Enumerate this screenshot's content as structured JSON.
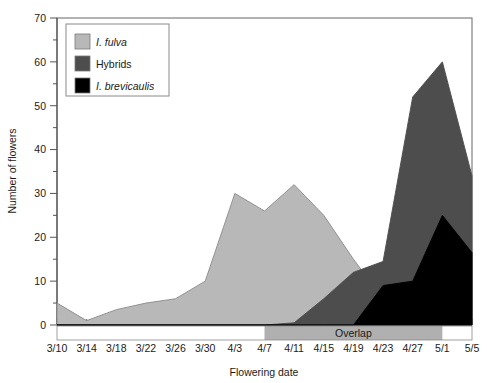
{
  "chart_data": {
    "type": "area",
    "title": "",
    "xlabel": "Flowering date",
    "ylabel": "Number of flowers",
    "categories": [
      "3/10",
      "3/14",
      "3/18",
      "3/22",
      "3/26",
      "3/30",
      "4/3",
      "4/7",
      "4/11",
      "4/15",
      "4/19",
      "4/23",
      "4/27",
      "5/1",
      "5/5"
    ],
    "x_tick_labels": [
      "3/10",
      "3/14",
      "3/18",
      "3/22",
      "3/26",
      "3/30",
      "4/3",
      "4/7",
      "4/11",
      "4/15",
      "4/19",
      "4/23",
      "4/27",
      "5/1",
      "5/5"
    ],
    "y_tick_labels": [
      "0",
      "10",
      "20",
      "30",
      "40",
      "50",
      "60",
      "70"
    ],
    "y_major_ticks": [
      0,
      10,
      20,
      30,
      40,
      50,
      60,
      70
    ],
    "y_minor_ticks": [
      5,
      15,
      25,
      35,
      45,
      55,
      65
    ],
    "ylim": [
      0,
      70
    ],
    "grid": false,
    "legend_position": "top-left",
    "series": [
      {
        "name": "I. fulva",
        "italic": true,
        "color": "#b8b8b8",
        "stroke": "#8a8a8a",
        "values": [
          5,
          1,
          3.5,
          5,
          6,
          10,
          30,
          26,
          32,
          25,
          15,
          6,
          4,
          1,
          0
        ]
      },
      {
        "name": "Hybrids",
        "italic": false,
        "color": "#4d4d4d",
        "stroke": "#4d4d4d",
        "values": [
          0,
          0,
          0,
          0,
          0,
          0,
          0,
          0,
          0.5,
          6,
          12,
          14.5,
          52,
          60,
          34
        ]
      },
      {
        "name": "I. brevicaulis",
        "italic": true,
        "color": "#000000",
        "stroke": "#000000",
        "values": [
          0,
          0,
          0,
          0,
          0,
          0,
          0,
          0,
          0,
          0,
          0,
          9,
          10,
          25,
          16.5
        ]
      }
    ],
    "annotations": [
      {
        "name": "overlap-bar",
        "label": "Overlap",
        "from": "4/7",
        "to": "5/1",
        "color": "#b0b0b0"
      }
    ]
  },
  "legend": {
    "items": [
      {
        "label": "I. fulva",
        "color": "#b8b8b8"
      },
      {
        "label": "Hybrids",
        "color": "#4d4d4d"
      },
      {
        "label": "I. brevicaulis",
        "color": "#000000"
      }
    ]
  },
  "axes": {
    "y_title": "Number of flowers",
    "x_title": "Flowering date"
  },
  "overlap": {
    "label": "Overlap"
  },
  "colors": {
    "fulva": "#b8b8b8",
    "hybrids": "#4d4d4d",
    "brevicaulis": "#000000",
    "overlap_bar": "#b0b0b0",
    "axis": "#555555",
    "frame": "#666666"
  }
}
